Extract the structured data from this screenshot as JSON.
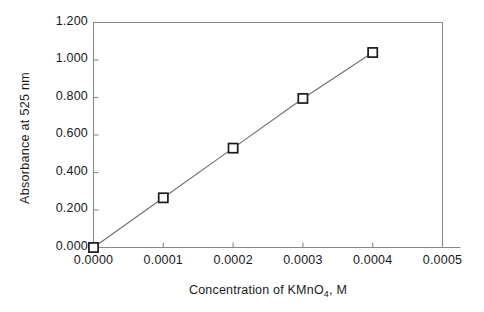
{
  "chart_data": {
    "type": "scatter",
    "title": "",
    "subtitle": "",
    "xlabel": "Concentration of KMnO4, M",
    "xlabel_rich": {
      "before": "Concentration of KMnO",
      "sub": "4",
      "after": ", M"
    },
    "ylabel": "Absorbance at 525 nm",
    "xlim": [
      0.0,
      0.0005
    ],
    "ylim": [
      0.0,
      1.2
    ],
    "xticks": [
      0.0,
      0.0001,
      0.0002,
      0.0003,
      0.0004,
      0.0005
    ],
    "yticks": [
      0.0,
      0.2,
      0.4,
      0.6,
      0.8,
      1.0,
      1.2
    ],
    "xtick_labels": [
      "0.0000",
      "0.0001",
      "0.0002",
      "0.0003",
      "0.0004",
      "0.0005"
    ],
    "ytick_labels": [
      "0.000",
      "0.200",
      "0.400",
      "0.600",
      "0.800",
      "1.000",
      "1.200"
    ],
    "grid": false,
    "legend": false,
    "legend_position": "none",
    "marker": "open-square",
    "line_style": "solid",
    "series": [
      {
        "name": "Absorbance vs concentration",
        "x": [
          0.0,
          0.0001,
          0.0002,
          0.0003,
          0.0004
        ],
        "values": [
          0.0,
          0.265,
          0.53,
          0.795,
          1.04
        ]
      }
    ],
    "points": [
      {
        "x": 0.0,
        "y": 0.0
      },
      {
        "x": 0.0001,
        "y": 0.265
      },
      {
        "x": 0.0002,
        "y": 0.53
      },
      {
        "x": 0.0003,
        "y": 0.795
      },
      {
        "x": 0.0004,
        "y": 1.04
      }
    ],
    "colors": {
      "line": "#6e6e6e",
      "marker_edge": "#1a1a1a",
      "marker_face": "#ffffff",
      "axis": "#8a8a8a",
      "text": "#1a1a1a",
      "background": "#ffffff"
    }
  }
}
